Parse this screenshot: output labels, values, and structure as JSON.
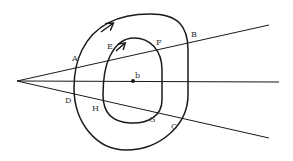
{
  "diagram": {
    "labels": {
      "A": "A",
      "B": "B",
      "C": "C",
      "D": "D",
      "E": "E",
      "F": "F",
      "G": "G",
      "H": "H",
      "b": "b"
    },
    "colors": {
      "stroke": "#1a1a1a",
      "text": "#333333",
      "background": "#ffffff"
    }
  }
}
